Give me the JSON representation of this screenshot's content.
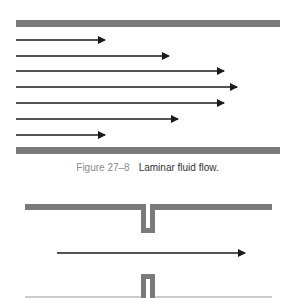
{
  "figure_top": {
    "name": "laminar-flow-diagram",
    "plate_color": "#7a7a7a",
    "arrow_color": "#1a1a1a",
    "arrows": [
      {
        "y": 40,
        "x_start": 16,
        "x_end": 107
      },
      {
        "y": 56,
        "x_start": 16,
        "x_end": 171
      },
      {
        "y": 71,
        "x_start": 16,
        "x_end": 226
      },
      {
        "y": 87,
        "x_start": 16,
        "x_end": 239
      },
      {
        "y": 103,
        "x_start": 16,
        "x_end": 226
      },
      {
        "y": 119,
        "x_start": 16,
        "x_end": 180
      },
      {
        "y": 135,
        "x_start": 16,
        "x_end": 107
      }
    ]
  },
  "caption": {
    "label": "Figure 27–8",
    "text": "Laminar fluid flow."
  },
  "figure_bottom": {
    "name": "orifice-flow-diagram",
    "arrow": {
      "y": 253,
      "x_start": 57,
      "x_end": 247
    }
  }
}
